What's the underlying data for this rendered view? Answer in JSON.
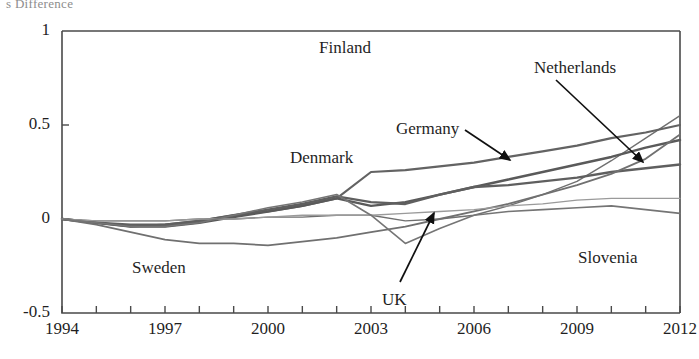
{
  "caption": "s Difference",
  "chart_data": {
    "type": "line",
    "title": "",
    "subtitle": "",
    "xlabel": "",
    "ylabel": "",
    "xlim": [
      1994,
      2012
    ],
    "ylim": [
      -0.5,
      1
    ],
    "grid": false,
    "legend_position": "inline-annotations",
    "x_ticks": [
      1994,
      1995,
      1996,
      1997,
      1998,
      1999,
      2000,
      2001,
      2002,
      2003,
      2004,
      2005,
      2006,
      2007,
      2008,
      2009,
      2010,
      2011,
      2012
    ],
    "x_tick_labels": [
      "1994",
      "",
      "",
      "1997",
      "",
      "",
      "2000",
      "",
      "",
      "2003",
      "",
      "",
      "2006",
      "",
      "",
      "2009",
      "",
      "",
      "2012"
    ],
    "y_ticks": [
      -0.5,
      0,
      0.5,
      1
    ],
    "y_tick_labels": [
      "-0.5",
      "0",
      "0.5",
      "1"
    ],
    "x": [
      1994,
      1995,
      1996,
      1997,
      1998,
      1999,
      2000,
      2001,
      2002,
      2003,
      2004,
      2005,
      2006,
      2007,
      2008,
      2009,
      2010,
      2011,
      2012
    ],
    "series": [
      {
        "name": "Finland",
        "color": "#6f6f6f",
        "width": 1.4,
        "values": [
          0.0,
          -0.01,
          -0.01,
          -0.01,
          0.0,
          0.0,
          0.01,
          0.01,
          0.02,
          0.02,
          -0.01,
          0.0,
          0.02,
          0.07,
          0.13,
          0.2,
          0.31,
          0.43,
          0.55
        ]
      },
      {
        "name": "Denmark",
        "color": "#636363",
        "width": 2.2,
        "values": [
          0.0,
          -0.02,
          -0.04,
          -0.03,
          -0.01,
          0.02,
          0.04,
          0.07,
          0.11,
          0.25,
          0.26,
          0.28,
          0.3,
          0.33,
          0.36,
          0.39,
          0.43,
          0.46,
          0.5
        ]
      },
      {
        "name": "Germany",
        "color": "#5a5a5a",
        "width": 2.4,
        "values": [
          0.0,
          -0.02,
          -0.04,
          -0.04,
          -0.02,
          0.01,
          0.04,
          0.07,
          0.11,
          0.07,
          0.09,
          0.13,
          0.17,
          0.21,
          0.25,
          0.29,
          0.33,
          0.38,
          0.42
        ]
      },
      {
        "name": "Netherlands",
        "color": "#5f5f5f",
        "width": 2.4,
        "values": [
          0.0,
          -0.02,
          -0.03,
          -0.03,
          -0.01,
          0.02,
          0.05,
          0.08,
          0.12,
          0.09,
          0.08,
          0.13,
          0.17,
          0.18,
          0.2,
          0.22,
          0.25,
          0.27,
          0.29
        ]
      },
      {
        "name": "Sweden",
        "color": "#707070",
        "width": 1.8,
        "values": [
          0.0,
          -0.03,
          -0.07,
          -0.11,
          -0.13,
          -0.13,
          -0.14,
          -0.12,
          -0.1,
          -0.07,
          -0.04,
          0.0,
          0.04,
          0.08,
          0.13,
          0.18,
          0.24,
          0.32,
          0.45
        ]
      },
      {
        "name": "Slovenia",
        "color": "#9a9a9a",
        "width": 1.3,
        "values": [
          0.0,
          -0.01,
          -0.01,
          -0.01,
          0.0,
          0.0,
          0.01,
          0.02,
          0.02,
          0.02,
          0.03,
          0.04,
          0.05,
          0.07,
          0.08,
          0.1,
          0.11,
          0.11,
          0.11
        ]
      },
      {
        "name": "UK",
        "color": "#757575",
        "width": 1.6,
        "values": [
          0.0,
          -0.02,
          -0.04,
          -0.04,
          -0.02,
          0.02,
          0.06,
          0.09,
          0.13,
          0.02,
          -0.13,
          -0.05,
          0.02,
          0.04,
          0.05,
          0.06,
          0.07,
          0.05,
          0.03
        ]
      }
    ],
    "annotations": [
      {
        "id": "finland",
        "label": "Finland",
        "x": 319,
        "y": 38,
        "arrow": false
      },
      {
        "id": "netherlands",
        "label": "Netherlands",
        "x": 534,
        "y": 58,
        "arrow": true,
        "ax1": 556,
        "ay1": 80,
        "ax2": 643,
        "ay2": 162
      },
      {
        "id": "germany",
        "label": "Germany",
        "x": 396,
        "y": 119,
        "arrow": true,
        "ax1": 465,
        "ay1": 130,
        "ax2": 510,
        "ay2": 160
      },
      {
        "id": "denmark",
        "label": "Denmark",
        "x": 290,
        "y": 148,
        "arrow": false
      },
      {
        "id": "slovenia",
        "label": "Slovenia",
        "x": 578,
        "y": 248,
        "arrow": false
      },
      {
        "id": "sweden",
        "label": "Sweden",
        "x": 132,
        "y": 258,
        "arrow": false
      },
      {
        "id": "uk",
        "label": "UK",
        "x": 382,
        "y": 290,
        "arrow": true,
        "ax1": 400,
        "ay1": 282,
        "ax2": 434,
        "ay2": 213
      }
    ]
  }
}
